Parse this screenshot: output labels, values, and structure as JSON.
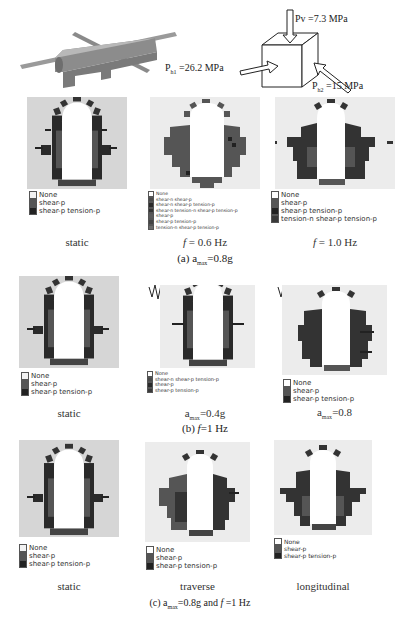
{
  "figure": {
    "stress_state": {
      "pv": "Pv =7.3 MPa",
      "ph1_main": "P",
      "ph1_sub": "h1",
      "ph1_val": " =26.2 MPa",
      "ph2_main": "P",
      "ph2_sub": "h2",
      "ph2_val": " =15 MPa"
    },
    "colors": {
      "background_plot": "#d6d6d6",
      "background_plot_light": "#ececec",
      "none": "#ffffff",
      "shear_p": "#555555",
      "shear_p_tension_p": "#222222",
      "shear_n_shear_p": "#4a4a4a",
      "other": "#6a6a6a"
    },
    "row_a": {
      "caption_prefix": "(a) a",
      "caption_sub": "max",
      "caption_suffix": "=0.8g",
      "panels": [
        {
          "label": "static",
          "legend": [
            "None",
            "shear-p",
            "shear-p tension-p"
          ]
        },
        {
          "label_f": "f",
          "label_rest": " = 0.6 Hz",
          "legend": [
            "None",
            "shear-n shear-p",
            "shear-n shear-p tension-p",
            "shear-n tension-n shear-p tension-p",
            "shear-p",
            "shear-p tension-p",
            "tension-n shear-p tension-p"
          ]
        },
        {
          "label_f": "f",
          "label_rest": " = 1.0 Hz",
          "legend": [
            "None",
            "shear-p",
            "shear-p tension-p",
            "tension-n shear-p tension-p"
          ]
        }
      ]
    },
    "row_b": {
      "caption_prefix": "(b) ",
      "caption_f": "f",
      "caption_suffix": "=1 Hz",
      "panels": [
        {
          "label": "static",
          "legend": [
            "None",
            "shear-p",
            "shear-p tension-p"
          ]
        },
        {
          "label_prefix": "a",
          "label_sub": "max",
          "label_suffix": "=0.4g",
          "legend": [
            "None",
            "shear-n shear-p tension-p",
            "shear-p",
            "shear-p tension-p"
          ]
        },
        {
          "label_prefix": "a",
          "label_sub": "max",
          "label_suffix": "=0.8",
          "legend": [
            "None",
            "shear-p",
            "shear-p tension-p"
          ]
        }
      ]
    },
    "row_c": {
      "caption_prefix": "(c) a",
      "caption_sub": "max",
      "caption_suffix": "=0.8g and ",
      "caption_f": "f",
      "caption_end": " =1 Hz",
      "panels": [
        {
          "label": "static",
          "legend": [
            "None",
            "shear-p",
            "shear-p tension-p"
          ]
        },
        {
          "label": "traverse",
          "legend": [
            "None",
            "shear-p",
            "shear-p tension-p"
          ]
        },
        {
          "label": "longitudinal",
          "legend": [
            "None",
            "shear-p",
            "shear-p tension-p"
          ]
        }
      ]
    }
  }
}
